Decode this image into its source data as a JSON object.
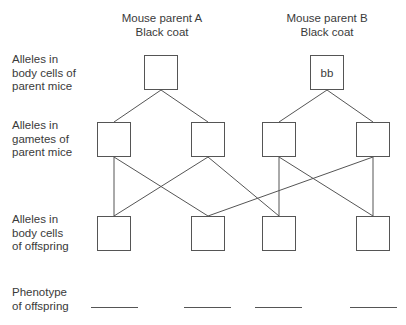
{
  "headers": {
    "parent_a": {
      "name": "Mouse parent A",
      "coat": "Black coat"
    },
    "parent_b": {
      "name": "Mouse parent B",
      "coat": "Black coat"
    }
  },
  "row_labels": {
    "parent_body_cells": [
      "Alleles in",
      "body cells of",
      "parent mice"
    ],
    "parent_gametes": [
      "Alleles in",
      "gametes of",
      "parent mice"
    ],
    "offspring_body_cells": [
      "Alleles in",
      "body cells",
      "of offspring"
    ],
    "offspring_phenotype": [
      "Phenotype",
      "of offspring"
    ]
  },
  "boxes": {
    "parent_a": "",
    "parent_b": "bb",
    "gametes": [
      "",
      "",
      "",
      ""
    ],
    "offspring": [
      "",
      "",
      "",
      ""
    ]
  },
  "phenotype_blanks": [
    "",
    "",
    "",
    ""
  ],
  "connections": [
    {
      "from": "parent_a",
      "to": "gamete_1"
    },
    {
      "from": "parent_a",
      "to": "gamete_2"
    },
    {
      "from": "parent_b",
      "to": "gamete_3"
    },
    {
      "from": "parent_b",
      "to": "gamete_4"
    },
    {
      "from": "gamete_1",
      "to": "offspring_1"
    },
    {
      "from": "gamete_1",
      "to": "offspring_2"
    },
    {
      "from": "gamete_2",
      "to": "offspring_1"
    },
    {
      "from": "gamete_2",
      "to": "offspring_3"
    },
    {
      "from": "gamete_3",
      "to": "offspring_3"
    },
    {
      "from": "gamete_3",
      "to": "offspring_4"
    },
    {
      "from": "gamete_4",
      "to": "offspring_2"
    },
    {
      "from": "gamete_4",
      "to": "offspring_4"
    }
  ]
}
